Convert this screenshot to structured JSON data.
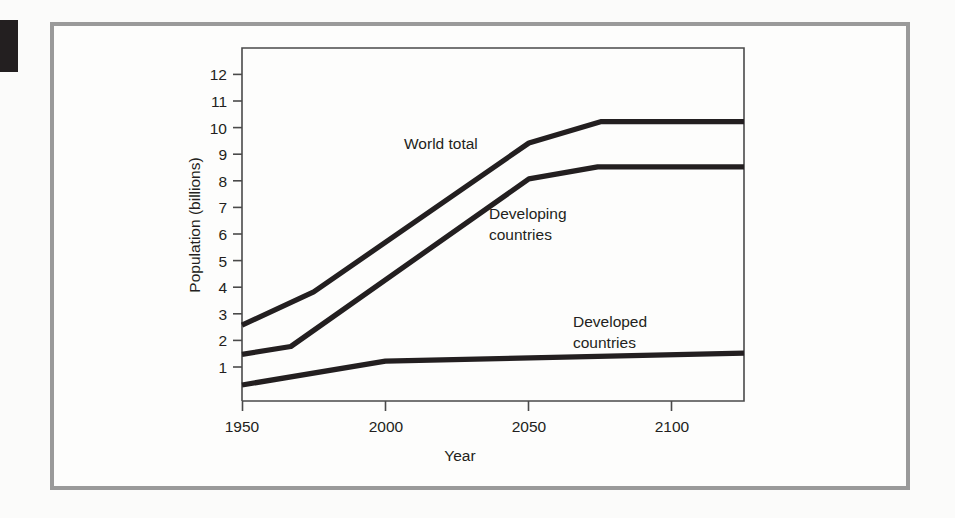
{
  "figure": {
    "background_color": "#fdfdfc",
    "frame_color": "#9a9a9a",
    "line_color": "#231f20"
  },
  "chart_data": {
    "type": "line",
    "title": "",
    "xlabel": "Year",
    "ylabel": "Population (billions)",
    "xlim": [
      1950,
      2125
    ],
    "ylim": [
      0,
      12.6
    ],
    "xticks": [
      1950,
      2000,
      2050,
      2100
    ],
    "xtick_labels": [
      "1950",
      "2000",
      "2050",
      "2100"
    ],
    "yticks": [
      1,
      2,
      3,
      4,
      5,
      6,
      7,
      8,
      9,
      10,
      11,
      12
    ],
    "ytick_labels": [
      "1",
      "2",
      "3",
      "4",
      "5",
      "6",
      "7",
      "8",
      "9",
      "10",
      "11",
      "12"
    ],
    "grid": false,
    "legend": "inline annotations",
    "series": [
      {
        "name": "World total",
        "label": "World total",
        "label_lines": [
          "World total"
        ],
        "x": [
          1950,
          1975,
          2050,
          2075,
          2125
        ],
        "values": [
          2.85,
          4.1,
          9.7,
          10.5,
          10.5
        ]
      },
      {
        "name": "Developing countries",
        "label": "Developing countries",
        "label_lines": [
          "Developing",
          "countries"
        ],
        "x": [
          1950,
          1967,
          2050,
          2074,
          2125
        ],
        "values": [
          1.75,
          2.05,
          8.35,
          8.8,
          8.8
        ]
      },
      {
        "name": "Developed countries",
        "label": "Developed countries",
        "label_lines": [
          "Developed",
          "countries"
        ],
        "x": [
          1950,
          2000,
          2125
        ],
        "values": [
          0.6,
          1.5,
          1.8
        ]
      }
    ]
  },
  "annotations": {
    "world_total": "World total",
    "developing_line1": "Developing",
    "developing_line2": "countries",
    "developed_line1": "Developed",
    "developed_line2": "countries"
  },
  "axis": {
    "y_title": "Population (billions)",
    "x_title": "Year",
    "ytick_1": "1",
    "ytick_2": "2",
    "ytick_3": "3",
    "ytick_4": "4",
    "ytick_5": "5",
    "ytick_6": "6",
    "ytick_7": "7",
    "ytick_8": "8",
    "ytick_9": "9",
    "ytick_10": "10",
    "ytick_11": "11",
    "ytick_12": "12",
    "xtick_1950": "1950",
    "xtick_2000": "2000",
    "xtick_2050": "2050",
    "xtick_2100": "2100"
  }
}
